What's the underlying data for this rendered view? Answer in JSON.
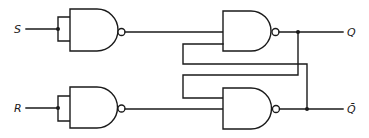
{
  "diagram": {
    "type": "circuit",
    "title": "",
    "colors": {
      "stroke": "#1a1a1a",
      "background": "#ffffff"
    },
    "inputs": [
      {
        "id": "S",
        "label": "S"
      },
      {
        "id": "R",
        "label": "R"
      }
    ],
    "outputs": [
      {
        "id": "Q",
        "label": "Q"
      },
      {
        "id": "Qbar",
        "label": "Q̄"
      }
    ],
    "gates": [
      {
        "id": "g1",
        "type": "NAND",
        "role": "input inverter (S, both inputs tied)"
      },
      {
        "id": "g2",
        "type": "NAND",
        "role": "latch gate producing Q"
      },
      {
        "id": "g3",
        "type": "NAND",
        "role": "input inverter (R, both inputs tied)"
      },
      {
        "id": "g4",
        "type": "NAND",
        "role": "latch gate producing Q̄"
      }
    ],
    "connections": [
      {
        "from": "S",
        "to": "g1.in1+in2"
      },
      {
        "from": "R",
        "to": "g3.in1+in2"
      },
      {
        "from": "g1.out",
        "to": "g2.in1"
      },
      {
        "from": "g3.out",
        "to": "g4.in2"
      },
      {
        "from": "g2.out",
        "to": "Q"
      },
      {
        "from": "g4.out",
        "to": "Qbar"
      },
      {
        "from": "g2.out (Q)",
        "to": "g4.in1",
        "kind": "feedback"
      },
      {
        "from": "g4.out (Q̄)",
        "to": "g2.in2",
        "kind": "feedback"
      }
    ]
  }
}
